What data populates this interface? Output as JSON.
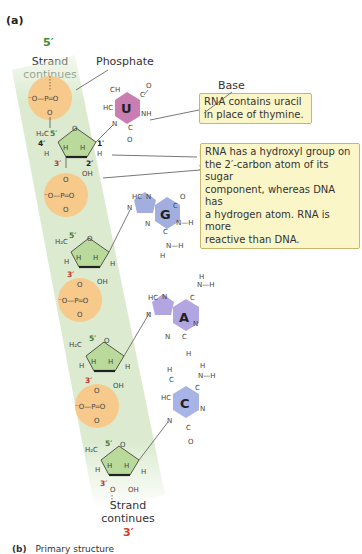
{
  "figure": {
    "panel_a_label": "(a)",
    "panel_b_label": "(b)",
    "panel_b_title": "Primary structure",
    "five_prime": "5′",
    "three_prime": "3′",
    "strand_top": [
      "Strand",
      "continues"
    ],
    "strand_bottom": [
      "Strand",
      "continues"
    ],
    "labels": {
      "phosphate": "Phosphate",
      "base": "Base",
      "ribose": [
        "Ribose",
        "sugar"
      ]
    },
    "callouts": [
      {
        "id": "uracil",
        "lines": [
          "RNA contains uracil",
          "in place of thymine."
        ]
      },
      {
        "id": "hydroxyl",
        "lines": [
          "RNA has a hydroxyl group on",
          "the 2′-carbon atom of its sugar",
          "component, whereas DNA has",
          "a hydrogen atom. RNA is more",
          "reactive than DNA."
        ]
      }
    ],
    "phosphate_group": {
      "o_minus": "⁻O",
      "p": "P",
      "o_double": "O",
      "o": "O"
    },
    "sugar_atoms": {
      "ch2": "H₂C",
      "o_ring": "O",
      "h": "H",
      "oh": "OH",
      "c5": "5′",
      "c4": "4′",
      "c3": "3′",
      "c2": "2′",
      "c1": "1′"
    },
    "bases": [
      {
        "letter": "U",
        "name": "uracil",
        "color": "#c97db0"
      },
      {
        "letter": "G",
        "name": "guanine",
        "color": "#a3aee0"
      },
      {
        "letter": "A",
        "name": "adenine",
        "color": "#b3a6e0"
      },
      {
        "letter": "C",
        "name": "cytosine",
        "color": "#a9b4e6"
      }
    ],
    "colors": {
      "backbone_band": "#dcebd0",
      "phosphate_circle": "#f7c98a",
      "sugar": "#b9da9a",
      "five_prime": "#3a8a3a",
      "three_prime": "#d0402b",
      "callout_bg": "#fbf6c8"
    }
  }
}
